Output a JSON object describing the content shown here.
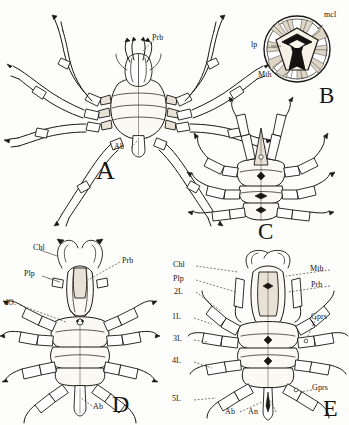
{
  "figure": {
    "background_color": "#fdfdfc",
    "ink_color": "#1a1714",
    "shade_color": "#e8e2d6"
  },
  "panels": [
    {
      "id": "A",
      "letter": "A",
      "subject": "whole-animal-dorsal-view",
      "labels": [
        {
          "key": "Prb",
          "text": "Prb",
          "meaning": "proboscis"
        },
        {
          "key": "Ab",
          "text": "Ab",
          "meaning": "abdomen"
        }
      ]
    },
    {
      "id": "B",
      "letter": "B",
      "subject": "mouth-terminal-view",
      "labels": [
        {
          "key": "mcl",
          "text": "mcl",
          "meaning": "muscle"
        },
        {
          "key": "lp",
          "text": "lp",
          "meaning": "lip"
        },
        {
          "key": "Mth",
          "text": "Mth",
          "meaning": "mouth"
        }
      ]
    },
    {
      "id": "C",
      "letter": "C",
      "subject": "whole-animal-anterior-oblique-view",
      "labels": []
    },
    {
      "id": "D",
      "letter": "D",
      "subject": "body-dorsal-view",
      "labels": [
        {
          "key": "Chl",
          "text": "Chl",
          "meaning": "chelicera"
        },
        {
          "key": "Plp",
          "text": "Plp",
          "meaning": "palp"
        },
        {
          "key": "dO",
          "text": "dO.",
          "meaning": "dorsal ocelli"
        },
        {
          "key": "Prb",
          "text": "Prb",
          "meaning": "proboscis"
        },
        {
          "key": "Ab",
          "text": "Ab",
          "meaning": "abdomen"
        }
      ]
    },
    {
      "id": "E",
      "letter": "E",
      "subject": "body-ventral-view",
      "labels": [
        {
          "key": "Chl",
          "text": "Chl",
          "meaning": "chelicera"
        },
        {
          "key": "Plp",
          "text": "Plp",
          "meaning": "palp"
        },
        {
          "key": "2L",
          "text": "2L",
          "meaning": "second leg"
        },
        {
          "key": "1L",
          "text": "1L",
          "meaning": "first leg"
        },
        {
          "key": "3L",
          "text": "3L",
          "meaning": "third leg"
        },
        {
          "key": "4L",
          "text": "4L",
          "meaning": "fourth leg"
        },
        {
          "key": "5L",
          "text": "5L",
          "meaning": "fifth leg"
        },
        {
          "key": "Mth",
          "text": "Mth",
          "meaning": "mouth"
        },
        {
          "key": "Prb",
          "text": "Prb",
          "meaning": "proboscis"
        },
        {
          "key": "Gprs_upper",
          "text": "Gprs",
          "meaning": "genital pores"
        },
        {
          "key": "Gprs_lower",
          "text": "Gprs",
          "meaning": "genital pores"
        },
        {
          "key": "Ab",
          "text": "Ab",
          "meaning": "abdomen"
        },
        {
          "key": "An",
          "text": "An",
          "meaning": "anus"
        }
      ]
    }
  ],
  "label_text": {
    "A": {
      "Prb": "Prb",
      "Ab": "Ab",
      "letter": "A"
    },
    "B": {
      "mcl": "mcl",
      "lp": "lp",
      "Mth": "Mth",
      "letter": "B"
    },
    "C": {
      "letter": "C"
    },
    "D": {
      "Chl": "Chl",
      "Plp": "Plp",
      "dO": "dO.",
      "Prb": "Prb",
      "Ab": "Ab",
      "letter": "D"
    },
    "E": {
      "Chl": "Chl",
      "Plp": "Plp",
      "L2": "2L",
      "L1": "1L",
      "L3": "3L",
      "L4": "4L",
      "L5": "5L",
      "Mth": "Mth",
      "Prb": "Prb",
      "Gprs1": "Gprs",
      "Gprs2": "Gprs",
      "Ab": "Ab",
      "An": "An",
      "letter": "E"
    }
  }
}
